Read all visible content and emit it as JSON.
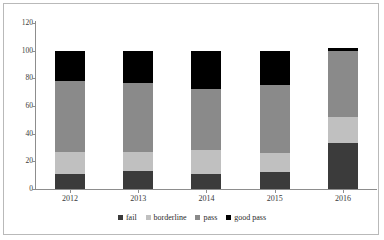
{
  "chart_data": {
    "type": "bar",
    "subtype": "stacked-bar",
    "title": "",
    "xlabel": "",
    "ylabel": "",
    "categories": [
      "2012",
      "2013",
      "2014",
      "2015",
      "2016"
    ],
    "ylim": [
      0,
      120
    ],
    "yticks": [
      0,
      20,
      40,
      60,
      80,
      100,
      120
    ],
    "ytick_labels": [
      "0",
      "20",
      "40",
      "60",
      "80",
      "100",
      "120"
    ],
    "grid": false,
    "legend_position": "bottom",
    "stack_order_bottom_to_top": [
      "fail",
      "borderline",
      "pass",
      "good pass"
    ],
    "series": [
      {
        "name": "fail",
        "color": "#3b3b3b",
        "values": [
          11,
          13,
          11,
          12,
          33
        ]
      },
      {
        "name": "borderline",
        "color": "#c0c0c0",
        "values": [
          16,
          14,
          17,
          14,
          19
        ]
      },
      {
        "name": "pass",
        "color": "#8a8a8a",
        "values": [
          51,
          50,
          44,
          49,
          48
        ]
      },
      {
        "name": "good pass",
        "color": "#000000",
        "values": [
          22,
          23,
          28,
          25,
          2
        ]
      }
    ],
    "totals": [
      100,
      100,
      100,
      100,
      102
    ]
  },
  "legend": {
    "items": [
      {
        "label": "fail",
        "color": "#3b3b3b"
      },
      {
        "label": "borderline",
        "color": "#c0c0c0"
      },
      {
        "label": "pass",
        "color": "#8a8a8a"
      },
      {
        "label": "good pass",
        "color": "#000000"
      }
    ]
  },
  "axes": {
    "y": {
      "labels": [
        "120",
        "100",
        "80",
        "60",
        "40",
        "20",
        "0"
      ]
    },
    "x": {
      "labels": [
        "2012",
        "2013",
        "2014",
        "2015",
        "2016"
      ]
    }
  }
}
